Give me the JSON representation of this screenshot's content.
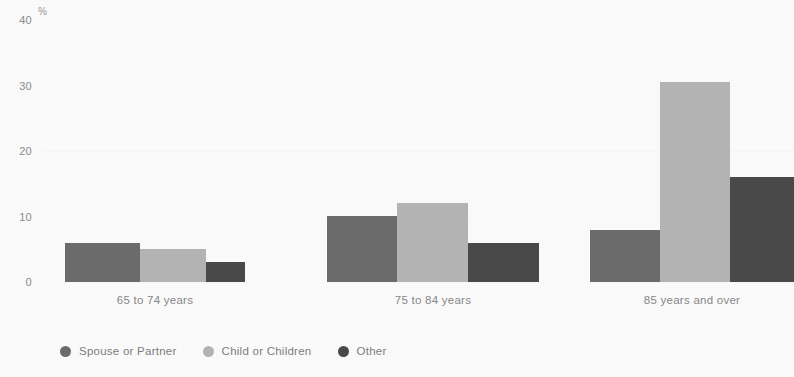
{
  "chart_data": {
    "type": "bar",
    "title": "",
    "subtitle": "",
    "xlabel": "",
    "ylabel": "%",
    "unit_label": "%",
    "categories": [
      "65 to 74 years",
      "75 to 84 years",
      "85 years and over"
    ],
    "series": [
      {
        "name": "Spouse or Partner",
        "color": "#6e6e6e",
        "values": [
          6,
          10,
          8
        ]
      },
      {
        "name": "Child or Children",
        "color": "#b7b7b7",
        "values": [
          5,
          12,
          30.5
        ]
      },
      {
        "name": "Other",
        "color": "#4b4b4b",
        "values": [
          3,
          6,
          16
        ]
      }
    ],
    "ylim": [
      0,
      40
    ],
    "yticks": [
      0,
      10,
      20,
      30,
      40
    ],
    "ytick_labels": [
      "0",
      "10",
      "20",
      "30",
      "40"
    ],
    "grid": true,
    "grid_axis": "y",
    "legend_position": "bottom-left",
    "bar_style": "grouped-adjacent",
    "annotations": []
  },
  "axes": {
    "y_unit": "%"
  },
  "legend": {
    "items": [
      {
        "label": "Spouse or Partner",
        "color": "#6e6e6e"
      },
      {
        "label": "Child or Children",
        "color": "#b7b7b7"
      },
      {
        "label": "Other",
        "color": "#4b4b4b"
      }
    ]
  }
}
